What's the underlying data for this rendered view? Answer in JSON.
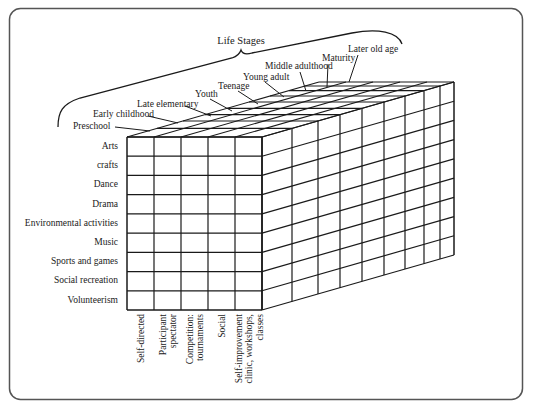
{
  "diagram": {
    "title": "Life Stages",
    "life_stages": [
      {
        "label": "Preschool",
        "x": 73,
        "y": 129
      },
      {
        "label": "Early childhood",
        "x": 93,
        "y": 117
      },
      {
        "label": "Late elementary",
        "x": 137,
        "y": 107
      },
      {
        "label": "Youth",
        "x": 195,
        "y": 97
      },
      {
        "label": "Teenage",
        "x": 218,
        "y": 89
      },
      {
        "label": "Young adult",
        "x": 243,
        "y": 80
      },
      {
        "label": "Middle adulthood",
        "x": 265,
        "y": 69
      },
      {
        "label": "Maturity",
        "x": 322,
        "y": 61
      },
      {
        "label": "Later old age",
        "x": 348,
        "y": 52
      }
    ],
    "activities": [
      "Arts",
      "crafts",
      "Dance",
      "Drama",
      "Environmental activities",
      "Music",
      "Sports and games",
      "Social recreation",
      "Volunteerism"
    ],
    "formats": [
      [
        "Self-directed"
      ],
      [
        "Participant",
        "spectator"
      ],
      [
        "Competition:",
        "tournaments"
      ],
      [
        "Social"
      ],
      [
        "Self-improvement",
        "clinic, workshops,",
        "classes"
      ]
    ],
    "colors": {
      "line": "#1a1a1a",
      "frame": "#555555",
      "background": "#ffffff"
    }
  }
}
